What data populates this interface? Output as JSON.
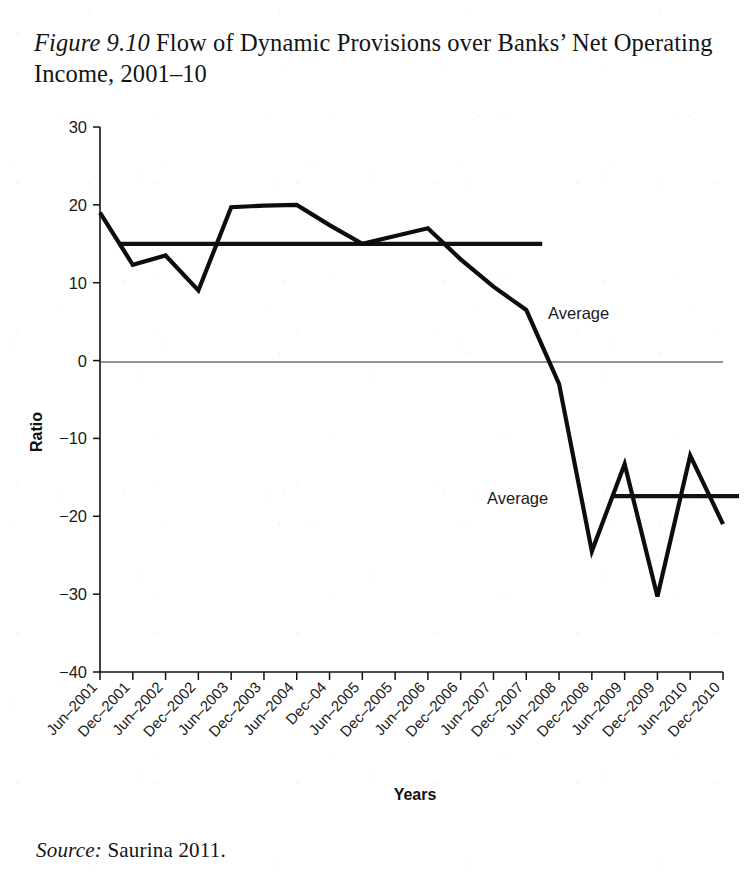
{
  "caption": {
    "figure_number": "Figure 9.10",
    "text": " Flow of Dynamic Provisions over Banks’ Net Operating Income, 2001–10"
  },
  "source": {
    "label": "Source:",
    "text": " Saurina 2011."
  },
  "annotations": {
    "average_upper": "Average",
    "average_lower": "Average"
  },
  "chart_data": {
    "type": "line",
    "title": "Flow of Dynamic Provisions over Banks’ Net Operating Income, 2001–10",
    "xlabel": "Years",
    "ylabel": "Ratio",
    "ylim": [
      -40,
      30
    ],
    "yticks": [
      30,
      20,
      10,
      0,
      -10,
      -20,
      -30,
      -40
    ],
    "ytick_labels": [
      "30",
      "20",
      "10",
      "0",
      "−10",
      "−20",
      "−30",
      "−40"
    ],
    "grid": false,
    "zero_line": true,
    "legend": "none",
    "categories": [
      "Jun–2001",
      "Dec–2001",
      "Jun–2002",
      "Dec–2002",
      "Jun–2003",
      "Dec–2003",
      "Jun–2004",
      "Dec–04",
      "Jun–2005",
      "Dec–2005",
      "Jun–2006",
      "Dec–2006",
      "Jun–2007",
      "Dec–2007",
      "Jun–2008",
      "Dec–2008",
      "Jun–2009",
      "Dec–2009",
      "Jun–2010",
      "Dec–2010"
    ],
    "series": [
      {
        "name": "Flow of dynamic provisions over net operating income",
        "values": [
          19.0,
          12.3,
          13.5,
          9.0,
          19.7,
          19.9,
          20.0,
          17.4,
          15.0,
          16.0,
          17.0,
          13.0,
          9.5,
          6.5,
          -3.0,
          -24.5,
          -13.3,
          -30.3,
          -12.2,
          -21.0
        ]
      }
    ],
    "reference_lines": [
      {
        "name": "Average",
        "value": 15.0,
        "x_start_category": "Jun–2001",
        "x_end_category": "Dec–2007"
      },
      {
        "name": "Average",
        "value": -17.4,
        "x_start_category": "Dec–2008",
        "x_end_category": "Dec–2010"
      }
    ]
  }
}
